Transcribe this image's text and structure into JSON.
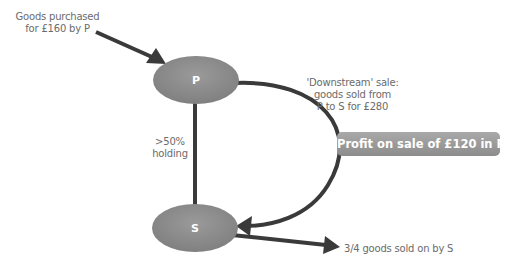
{
  "nodes": {
    "p": {
      "label": "P"
    },
    "s": {
      "label": "S"
    }
  },
  "labels": {
    "purchase": [
      "Goods purchased",
      "for £160 by P"
    ],
    "downstream": [
      "'Downstream' sale:",
      "goods sold from",
      "P to S for £280"
    ],
    "holding": [
      ">50%",
      "holding"
    ],
    "sold_on": "3/4 goods sold on by S"
  },
  "badge": {
    "text": "Profit on sale of £120 in P"
  },
  "colors": {
    "node": "#8f8f8f",
    "arrow": "#3a3a3a",
    "badge": "#999999",
    "text": "#6b6b6b"
  }
}
